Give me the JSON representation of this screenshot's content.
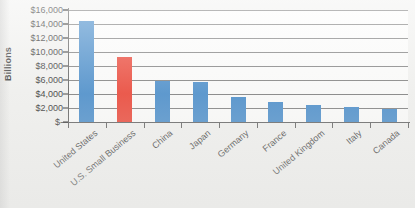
{
  "chart_data": {
    "type": "bar",
    "title": "",
    "xlabel": "",
    "ylabel": "Billions",
    "ylim": [
      0,
      16000
    ],
    "ytick_step": 2000,
    "grid": true,
    "legend": "none",
    "value_prefix": "$",
    "categories": [
      "United States",
      "U.S. Small Business",
      "China",
      "Japan",
      "Germany",
      "France",
      "United Kingdom",
      "Italy",
      "Canada"
    ],
    "values": [
      14500,
      9300,
      5900,
      5700,
      3600,
      2900,
      2500,
      2200,
      1800
    ],
    "bar_colors": [
      "#2f7dc4",
      "#ea2a19",
      "#2f7dc4",
      "#2f7dc4",
      "#2f7dc4",
      "#2f7dc4",
      "#2f7dc4",
      "#2f7dc4",
      "#2f7dc4"
    ],
    "highlight_index": 1,
    "ytick_labels": [
      "$16,000",
      "$14,000",
      "$12,000",
      "$10,000",
      "$8,000",
      "$6,000",
      "$4,000",
      "$2,000",
      "$-"
    ],
    "ytick_values": [
      16000,
      14000,
      12000,
      10000,
      8000,
      6000,
      4000,
      2000,
      0
    ],
    "series": [
      {
        "name": "GDP",
        "values": [
          14500,
          9300,
          5900,
          5700,
          3600,
          2900,
          2500,
          2200,
          1800
        ]
      }
    ]
  },
  "colors": {
    "bar_blue": "#2f7dc4",
    "bar_red": "#ea2a19",
    "gridline": "#6e6e6e",
    "axis": "#4a4a4a",
    "plot_background": "#fdfdfc",
    "page_background": "#f1f1ef",
    "text": "#1a1a1a"
  }
}
